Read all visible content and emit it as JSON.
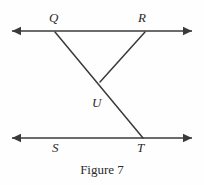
{
  "figure": {
    "caption": "Figure 7",
    "caption_x": 0,
    "caption_y": 162,
    "width": 204,
    "height": 185,
    "background_color": "#fefefe",
    "stroke_color": "#3a3a3a",
    "label_color": "#2b2b2b"
  },
  "labels": [
    {
      "id": "Q",
      "text": "Q",
      "x": 49,
      "y": 11,
      "style": "italic"
    },
    {
      "id": "R",
      "text": "R",
      "x": 138,
      "y": 11,
      "style": "italic"
    },
    {
      "id": "U",
      "text": "U",
      "x": 92,
      "y": 96,
      "style": "italic"
    },
    {
      "id": "S",
      "text": "S",
      "x": 52,
      "y": 141,
      "style": "italic"
    },
    {
      "id": "T",
      "text": "T",
      "x": 137,
      "y": 141,
      "style": "italic"
    }
  ],
  "lines": [
    {
      "id": "top-line",
      "name": "line-QR",
      "x1": 12,
      "y1": 31,
      "x2": 192,
      "y2": 31,
      "arrow_start": true,
      "arrow_end": true,
      "stroke_width": 1.6
    },
    {
      "id": "bottom-line",
      "name": "line-ST",
      "x1": 12,
      "y1": 138,
      "x2": 192,
      "y2": 138,
      "arrow_start": true,
      "arrow_end": true,
      "stroke_width": 1.6
    },
    {
      "id": "transversal-QT",
      "name": "segment-Q-to-T",
      "x1": 55,
      "y1": 32,
      "x2": 143,
      "y2": 138,
      "arrow_start": false,
      "arrow_end": false,
      "stroke_width": 1.5
    },
    {
      "id": "segment-RU",
      "name": "segment-R-to-U",
      "x1": 145,
      "y1": 32,
      "x2": 100,
      "y2": 82,
      "arrow_start": false,
      "arrow_end": false,
      "stroke_width": 1.5
    }
  ],
  "chart_data": {
    "type": "diagram",
    "title": "Figure 7",
    "points": [
      {
        "label": "Q",
        "x": 55,
        "y": 31,
        "on": "top-line"
      },
      {
        "label": "R",
        "x": 145,
        "y": 31,
        "on": "top-line"
      },
      {
        "label": "U",
        "x": 100,
        "y": 82,
        "on": "intersection-of-QT-and-RU"
      },
      {
        "label": "S",
        "x": 57,
        "y": 138,
        "on": "bottom-line"
      },
      {
        "label": "T",
        "x": 143,
        "y": 138,
        "on": "bottom-line"
      }
    ],
    "segments": [
      {
        "from": "Q",
        "to": "T"
      },
      {
        "from": "R",
        "to": "U"
      }
    ],
    "rays": [
      {
        "name": "top-line",
        "through": [
          "Q",
          "R"
        ],
        "both_directions": true
      },
      {
        "name": "bottom-line",
        "through": [
          "S",
          "T"
        ],
        "both_directions": true
      }
    ]
  }
}
